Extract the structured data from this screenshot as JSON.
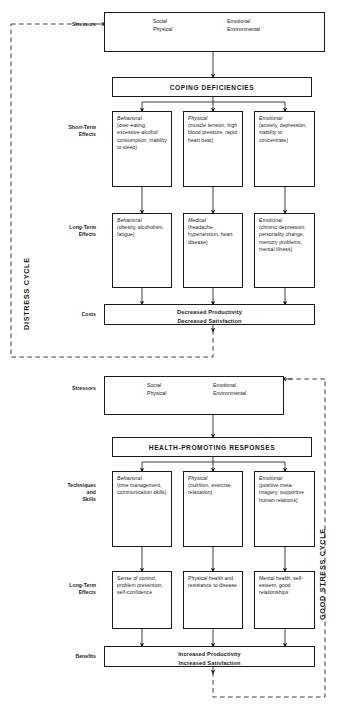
{
  "diagram": {
    "cycles": {
      "distress_label": "DISTRESS CYCLE",
      "good_stress_label": "GOOD STRESS CYCLE"
    },
    "colors": {
      "line": "#1a1a1a",
      "background": "#ffffff",
      "text": "#1a1a1a"
    },
    "distress": {
      "stressors_label": "Stressors",
      "stressors": {
        "col1_line1": "Social",
        "col1_line2": "Physical",
        "col2_line1": "Emotional",
        "col2_line2": "Environmental"
      },
      "banner": "COPING DEFICIENCIES",
      "short_term_label_line1": "Short-Term",
      "short_term_label_line2": "Effects",
      "short_term": [
        {
          "heading": "Behavioral",
          "body": "(over-eating, excessive alcohol consumption, inability to sleep)"
        },
        {
          "heading": "Physical",
          "body": "(muscle tension, high blood pressure, rapid heart beat)"
        },
        {
          "heading": "Emotional",
          "body": "(anxiety, depression, inability to concentrate)"
        }
      ],
      "long_term_label_line1": "Long-Term",
      "long_term_label_line2": "Effects",
      "long_term": [
        {
          "heading": "Behavioral",
          "body": "(obesity, alcoholism, fatigue)"
        },
        {
          "heading": "Medical",
          "body": "(headache, hypertension, heart disease)"
        },
        {
          "heading": "Emotional",
          "body": "(chronic depression, personality change, memory problems, mental illness)"
        }
      ],
      "outcome_label": "Costs",
      "outcome_line1": "Decreased Productivity",
      "outcome_line2": "Decreased Satisfaction"
    },
    "good_stress": {
      "stressors_label": "Stressors",
      "stressors": {
        "col1_line1": "Social",
        "col1_line2": "Physical",
        "col2_line1": "Emotional",
        "col2_line2": "Environmental"
      },
      "banner": "HEALTH-PROMOTING RESPONSES",
      "techniques_label_line1": "Techniques",
      "techniques_label_line2": "and",
      "techniques_label_line3": "Skills",
      "techniques": [
        {
          "heading": "Behavioral",
          "body": "(time management, communication skills)"
        },
        {
          "heading": "Physical",
          "body": "(nutrition, exercise, relaxation)"
        },
        {
          "heading": "Emotional",
          "body": "(positive meta-imagery, supportive human relations)"
        }
      ],
      "long_term_label_line1": "Long-Term",
      "long_term_label_line2": "Effects",
      "long_term": [
        {
          "heading": "",
          "body": "Sense of control, problem prevention, self-confidence"
        },
        {
          "heading": "",
          "body": "Physical health and resistance to disease"
        },
        {
          "heading": "",
          "body": "Mental health, self-esteem, good relationships"
        }
      ],
      "outcome_label": "Benefits",
      "outcome_line1": "Increased Productivity",
      "outcome_line2": "Increased Satisfaction"
    }
  }
}
